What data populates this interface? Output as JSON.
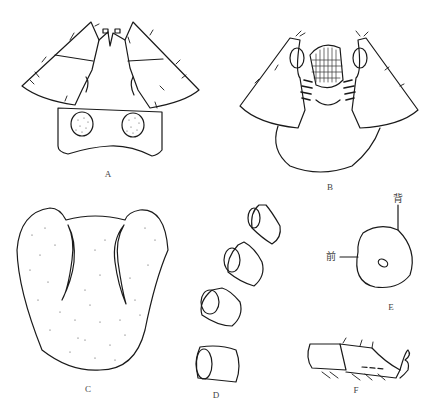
{
  "figure": {
    "panels": [
      {
        "id": "A",
        "label": "A",
        "subject": "head-ventral-view"
      },
      {
        "id": "B",
        "label": "B",
        "subject": "head-with-mouthparts"
      },
      {
        "id": "C",
        "label": "C",
        "subject": "labium-stippled"
      },
      {
        "id": "D",
        "label": "D",
        "subject": "antennal-segments"
      },
      {
        "id": "E",
        "label": "E",
        "subject": "cross-section",
        "annotations": {
          "dorsal": "背",
          "anterior": "前"
        }
      },
      {
        "id": "F",
        "label": "F",
        "subject": "leg-tarsus"
      }
    ],
    "colors": {
      "ink": "#1a1a1a",
      "background": "#ffffff",
      "label": "#444444"
    }
  }
}
